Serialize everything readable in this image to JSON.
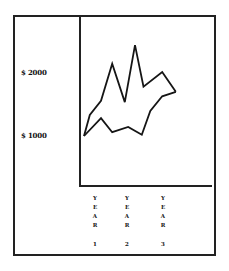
{
  "chart_data": {
    "type": "line",
    "title": "",
    "xlabel": "",
    "ylabel": "",
    "y_ticks": [
      "$ 2000",
      "$ 1000"
    ],
    "y_tick_values": [
      2000,
      1000
    ],
    "x_ticks": [
      "YEAR 1",
      "YEAR 2",
      "YEAR 3"
    ],
    "grid": false,
    "legend": null,
    "series": [
      {
        "name": "upper",
        "x": [
          0,
          0.17,
          0.5,
          0.83,
          1.2,
          1.5,
          1.75,
          2.3,
          2.7
        ],
        "values": [
          1000,
          1330,
          1550,
          2130,
          1530,
          2420,
          1770,
          2000,
          1690
        ]
      },
      {
        "name": "lower",
        "x": [
          0,
          0.5,
          0.83,
          1.3,
          1.7,
          1.95,
          2.3,
          2.7
        ],
        "values": [
          1000,
          1280,
          1060,
          1140,
          1020,
          1390,
          1620,
          1690
        ]
      }
    ]
  },
  "labels": {
    "y_top": "$ 2000",
    "y_bottom": "$ 1000",
    "x": [
      {
        "letters": [
          "Y",
          "E",
          "A",
          "R"
        ],
        "num": "1"
      },
      {
        "letters": [
          "Y",
          "E",
          "A",
          "R"
        ],
        "num": "2"
      },
      {
        "letters": [
          "Y",
          "E",
          "A",
          "R"
        ],
        "num": "3"
      }
    ]
  },
  "colors": {
    "line": "#151515",
    "frame": "#222222",
    "background": "#ffffff"
  }
}
